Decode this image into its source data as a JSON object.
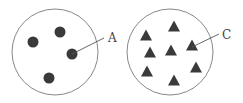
{
  "diagram": {
    "colors": {
      "outline": "#888888",
      "particle": "#3a3a3a",
      "label": "#444444",
      "leader": "#555555"
    },
    "left": {
      "shape": "circle",
      "cx": 55,
      "cy": 52,
      "r": 43,
      "particle_type": "dot",
      "particles": [
        {
          "x": 33,
          "y": 42
        },
        {
          "x": 60,
          "y": 32
        },
        {
          "x": 72,
          "y": 54
        },
        {
          "x": 49,
          "y": 78
        }
      ],
      "label": {
        "text": "A",
        "x": 108,
        "y": 42,
        "points_to": {
          "x": 72,
          "y": 54
        },
        "line_end": {
          "x": 104,
          "y": 38
        }
      }
    },
    "right": {
      "shape": "circle",
      "cx": 170,
      "cy": 52,
      "r": 43,
      "particle_type": "triangle",
      "particles": [
        {
          "x": 174,
          "y": 26
        },
        {
          "x": 146,
          "y": 35
        },
        {
          "x": 150,
          "y": 52
        },
        {
          "x": 171,
          "y": 50
        },
        {
          "x": 192,
          "y": 45
        },
        {
          "x": 147,
          "y": 71
        },
        {
          "x": 196,
          "y": 67
        },
        {
          "x": 174,
          "y": 80
        }
      ],
      "label": {
        "text": "C",
        "x": 222,
        "y": 39,
        "points_to": {
          "x": 192,
          "y": 47
        },
        "line_end": {
          "x": 219,
          "y": 34
        }
      }
    }
  }
}
